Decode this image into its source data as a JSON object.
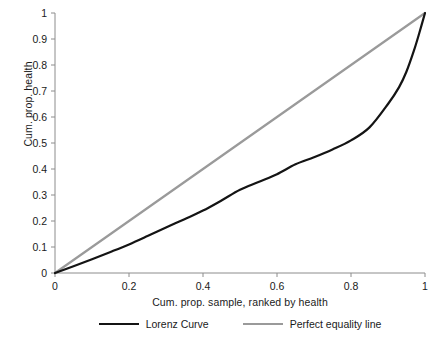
{
  "chart_data": {
    "type": "line",
    "title": "",
    "xlabel": "Cum. prop. sample, ranked by health",
    "ylabel": "Cum. prop. health",
    "xlim": [
      0,
      1
    ],
    "ylim": [
      0,
      1
    ],
    "grid": false,
    "legend_position": "bottom",
    "xticks": [
      "0",
      "0.2",
      "0.4",
      "0.6",
      "0.8",
      "1"
    ],
    "xtick_values": [
      0,
      0.2,
      0.4,
      0.6,
      0.8,
      1
    ],
    "yticks": [
      "0",
      "0.1",
      "0.2",
      "0.3",
      "0.4",
      "0.5",
      "0.6",
      "0.7",
      "0.8",
      "0.9",
      "1"
    ],
    "ytick_values": [
      0,
      0.1,
      0.2,
      0.3,
      0.4,
      0.5,
      0.6,
      0.7,
      0.8,
      0.9,
      1
    ],
    "series": [
      {
        "name": "Lorenz Curve",
        "color": "#141414",
        "width": 2.2,
        "x": [
          0,
          0.05,
          0.1,
          0.15,
          0.2,
          0.25,
          0.3,
          0.35,
          0.4,
          0.45,
          0.5,
          0.55,
          0.6,
          0.65,
          0.7,
          0.75,
          0.8,
          0.85,
          0.9,
          0.93,
          0.95,
          0.97,
          0.985,
          1
        ],
        "values": [
          0,
          0.026,
          0.053,
          0.081,
          0.11,
          0.142,
          0.175,
          0.207,
          0.24,
          0.279,
          0.32,
          0.35,
          0.38,
          0.418,
          0.445,
          0.475,
          0.51,
          0.56,
          0.65,
          0.715,
          0.775,
          0.855,
          0.925,
          1
        ]
      },
      {
        "name": "Perfect equality line",
        "color": "#9a9a9a",
        "width": 2.2,
        "x": [
          0,
          1
        ],
        "values": [
          0,
          1
        ]
      }
    ],
    "legend": [
      {
        "label": "Lorenz Curve",
        "color": "#141414"
      },
      {
        "label": "Perfect equality line",
        "color": "#9a9a9a"
      }
    ]
  },
  "axis": {
    "color": "#8c8c8c"
  }
}
